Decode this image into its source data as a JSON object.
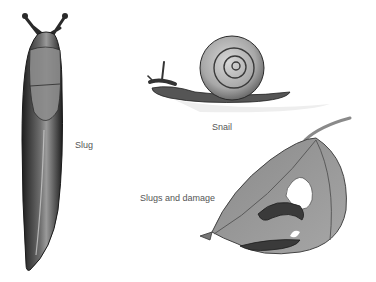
{
  "labels": {
    "slug": "Slug",
    "snail": "Snail",
    "damage": "Slugs and damage"
  },
  "colors": {
    "background": "#ffffff",
    "label_text": "#555555",
    "ink_dark": "#2a2a2a",
    "body_mid": "#6a6a6a",
    "leaf_fill": "#9a9a9a",
    "leaf_light": "#b4b4b4"
  }
}
